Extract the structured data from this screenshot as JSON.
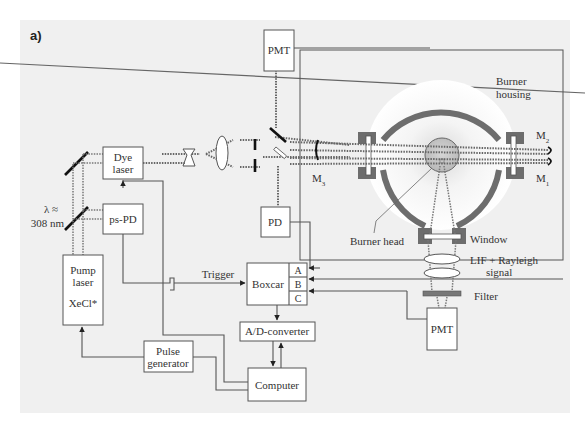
{
  "panel_label": "a)",
  "components": {
    "pmt_top": "PMT",
    "pmt_bottom": "PMT",
    "dye_laser": [
      "Dye",
      "laser"
    ],
    "ps_pd": "ps-PD",
    "pd": "PD",
    "pump_laser": [
      "Pump",
      "laser",
      "XeCl*"
    ],
    "boxcar": "Boxcar",
    "boxcar_channels": [
      "A",
      "B",
      "C"
    ],
    "ad_converter": "A/D-converter",
    "computer": "Computer",
    "pulse_generator": [
      "Pulse",
      "generator"
    ]
  },
  "annotations": {
    "wavelength": [
      "λ ≈",
      "308 nm"
    ],
    "trigger": "Trigger",
    "burner_housing": [
      "Burner",
      "housing"
    ],
    "burner_head": "Burner head",
    "window": "Window",
    "signal": [
      "LIF + Rayleigh",
      "signal"
    ],
    "filter": "Filter",
    "m1": "M",
    "m1_sub": "1",
    "m2": "M",
    "m2_sub": "2",
    "m3": "M",
    "m3_sub": "3"
  },
  "colors": {
    "panel_bg": "#f0f0f0",
    "housing": "#6d6d6d",
    "line": "#555555"
  }
}
